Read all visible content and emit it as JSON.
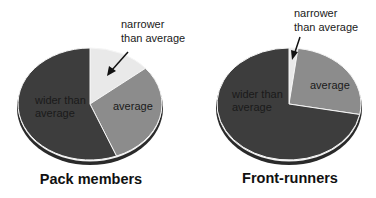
{
  "chart_data": [
    {
      "type": "pie",
      "title": "Pack members",
      "categories": [
        "narrower than average",
        "average",
        "wider than average"
      ],
      "values": [
        14,
        30,
        56
      ],
      "unit": "percent (estimated)",
      "colors": [
        "#e9e9e9",
        "#8c8c8c",
        "#3d3d3d"
      ],
      "annotations": [
        {
          "text": "narrower than average",
          "target": "narrower than average",
          "arrow": true
        }
      ]
    },
    {
      "type": "pie",
      "title": "Front-runners",
      "categories": [
        "narrower than average",
        "average",
        "wider than average"
      ],
      "values": [
        2,
        26,
        72
      ],
      "unit": "percent (estimated)",
      "colors": [
        "#e9e9e9",
        "#8c8c8c",
        "#3d3d3d"
      ],
      "annotations": [
        {
          "text": "narrower than average",
          "target": "narrower than average",
          "arrow": true
        }
      ]
    }
  ],
  "left": {
    "title": "Pack members",
    "label_narrow_1": "narrower",
    "label_narrow_2": "than average",
    "label_avg": "average",
    "label_wide_1": "wider than",
    "label_wide_2": "average"
  },
  "right": {
    "title": "Front-runners",
    "label_narrow_1": "narrower",
    "label_narrow_2": "than average",
    "label_avg": "average",
    "label_wide_1": "wider than",
    "label_wide_2": "average"
  }
}
